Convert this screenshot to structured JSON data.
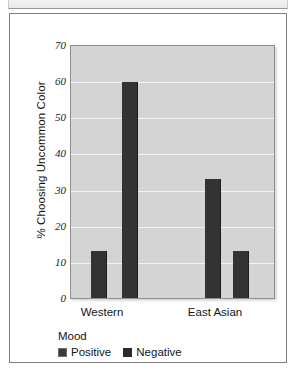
{
  "figure": {
    "background_color": "#ffffff",
    "frame_color": "#808080",
    "panel_color": "#d4d4d4",
    "gridline_color": "#f4f4f4",
    "bar_color": "#333333"
  },
  "chart_data": {
    "type": "bar",
    "title": "",
    "xlabel": "",
    "ylabel": "% Choosing Uncommon Color",
    "ylim": [
      0,
      70
    ],
    "yticks": [
      0,
      10,
      20,
      30,
      40,
      50,
      60,
      70
    ],
    "ytick_labels": [
      "0",
      "10",
      "20",
      "30",
      "40",
      "50",
      "60",
      "70"
    ],
    "grid": true,
    "grid_axis": "y",
    "categories": [
      "Western",
      "East Asian"
    ],
    "series": [
      {
        "name": "Positive",
        "values": [
          13,
          33
        ],
        "color": "#333333"
      },
      {
        "name": "Negative",
        "values": [
          60,
          13
        ],
        "color": "#333333"
      }
    ],
    "legend": {
      "title": "Mood",
      "position": "below-axis-left",
      "entries": [
        "Positive",
        "Negative"
      ]
    }
  }
}
